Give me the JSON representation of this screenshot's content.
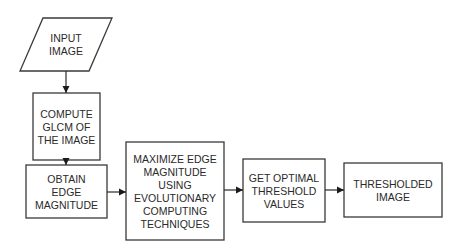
{
  "diagram": {
    "type": "flowchart",
    "nodes": [
      {
        "id": "input",
        "shape": "parallelogram",
        "lines": [
          "INPUT",
          "IMAGE"
        ]
      },
      {
        "id": "glcm",
        "shape": "rect",
        "lines": [
          "COMPUTE",
          "GLCM OF",
          "THE IMAGE"
        ]
      },
      {
        "id": "edge",
        "shape": "rect",
        "lines": [
          "OBTAIN",
          "EDGE",
          "MAGNITUDE"
        ]
      },
      {
        "id": "maximize",
        "shape": "rect",
        "lines": [
          "MAXIMIZE EDGE",
          "MAGNITUDE",
          "USING",
          "EVOLUTIONARY",
          "COMPUTING",
          "TECHNIQUES"
        ]
      },
      {
        "id": "optimal",
        "shape": "rect",
        "lines": [
          "GET OPTIMAL",
          "THRESHOLD",
          "VALUES"
        ]
      },
      {
        "id": "output",
        "shape": "rect",
        "lines": [
          "THRESHOLDED",
          "IMAGE"
        ]
      }
    ],
    "edges": [
      {
        "from": "input",
        "to": "glcm"
      },
      {
        "from": "glcm",
        "to": "edge"
      },
      {
        "from": "edge",
        "to": "maximize"
      },
      {
        "from": "maximize",
        "to": "optimal"
      },
      {
        "from": "optimal",
        "to": "output"
      }
    ]
  }
}
